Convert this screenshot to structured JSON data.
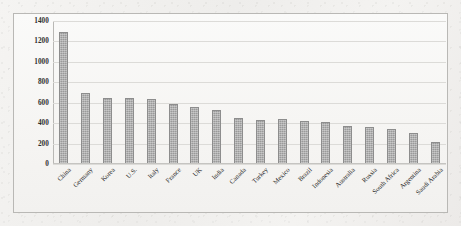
{
  "chart_data": {
    "type": "bar",
    "title": "",
    "subtitle": "",
    "xlabel": "",
    "ylabel": "",
    "ylim": [
      0,
      1400
    ],
    "ytick_step": 200,
    "yticks": [
      0,
      200,
      400,
      600,
      800,
      1000,
      1200,
      1400
    ],
    "ytick_labels": [
      "0",
      "200",
      "400",
      "600",
      "800",
      "1000",
      "1200",
      "1400"
    ],
    "grid": true,
    "legend": false,
    "legend_position": "none",
    "bar_color": "#9a9a9a",
    "bar_border_color": "#8d8d8d",
    "categories": [
      "China",
      "Germany",
      "Korea",
      "U.S.",
      "Italy",
      "France",
      "UK",
      "India",
      "Canada",
      "Turkey",
      "Mexico",
      "Brazil",
      "Indonesia",
      "Australia",
      "Russia",
      "South Africa",
      "Argentina",
      "Saudi Arabia"
    ],
    "values": [
      1290,
      700,
      645,
      645,
      640,
      590,
      560,
      525,
      450,
      435,
      440,
      425,
      415,
      370,
      365,
      345,
      305,
      215
    ]
  },
  "figure": {
    "background_color": "#f2f1ef",
    "plot_background_color": "#f8f7f5",
    "frame_color": "#b9b8b5",
    "gridline_color": "#dcdbd8"
  }
}
